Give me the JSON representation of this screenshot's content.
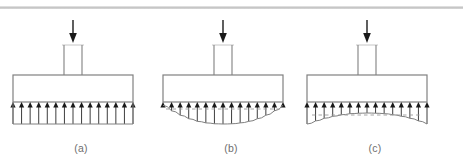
{
  "figure": {
    "width": 463,
    "height": 158,
    "background": "#ffffff",
    "divider_color": "#c2c2c2",
    "outline_color": "#808080",
    "arrow_color": "#1a1a1a",
    "label_color": "#6e6e6e",
    "dashed_color": "#9a9a9a"
  },
  "panels": [
    {
      "id": "a",
      "label": "(a)",
      "description": "uniform soil pressure distribution beneath rigid footing",
      "pressure_profile": "uniform",
      "arrow_count": 15,
      "load_arrow": "downward-point-load",
      "has_dashed_reference": false
    },
    {
      "id": "b",
      "label": "(b)",
      "description": "sagging parabolic pressure distribution, maximum at center (cohesive clay)",
      "pressure_profile": "sagging-parabolic",
      "arrow_count": 15,
      "load_arrow": "downward-point-load",
      "has_dashed_reference": true
    },
    {
      "id": "c",
      "label": "(c)",
      "description": "arched pressure distribution, maximum at edges (granular sand)",
      "pressure_profile": "arched-hogging",
      "arrow_count": 15,
      "load_arrow": "downward-point-load",
      "has_dashed_reference": true
    }
  ],
  "chart_data": {
    "type": "line",
    "title": "",
    "xlabel": "",
    "ylabel": "Contact pressure",
    "grid": false,
    "legend": "none",
    "x": [
      0,
      0.0714,
      0.1429,
      0.2143,
      0.2857,
      0.3571,
      0.4286,
      0.5,
      0.5714,
      0.6429,
      0.7143,
      0.7857,
      0.8571,
      0.9286,
      1.0
    ],
    "xlim": [
      0,
      1
    ],
    "ylim": [
      0,
      1
    ],
    "series": [
      {
        "name": "(a) uniform",
        "values": [
          1,
          1,
          1,
          1,
          1,
          1,
          1,
          1,
          1,
          1,
          1,
          1,
          1,
          1,
          1
        ]
      },
      {
        "name": "(b) sagging parabolic",
        "values": [
          0.15,
          0.4,
          0.6,
          0.76,
          0.88,
          0.95,
          0.99,
          1.0,
          0.99,
          0.95,
          0.88,
          0.76,
          0.6,
          0.4,
          0.15
        ]
      },
      {
        "name": "(c) arched",
        "values": [
          1.0,
          0.86,
          0.74,
          0.65,
          0.58,
          0.53,
          0.51,
          0.5,
          0.51,
          0.53,
          0.58,
          0.65,
          0.74,
          0.86,
          1.0
        ]
      }
    ]
  }
}
